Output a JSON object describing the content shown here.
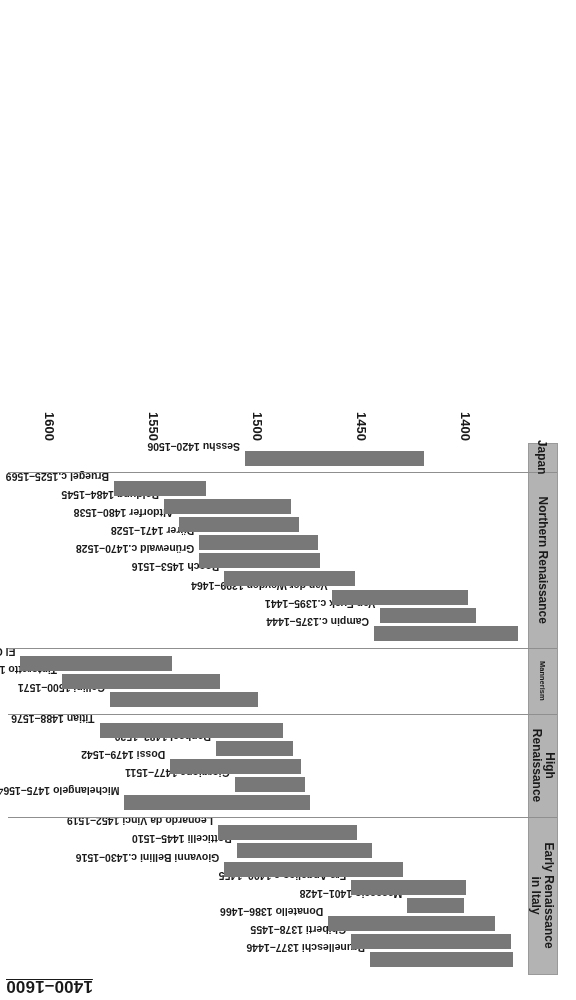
{
  "chart_data": {
    "type": "bar",
    "orientation": "timeline-horizontal-spans",
    "title": "1400–1600",
    "xlabel": "",
    "ylabel": "",
    "xlim": [
      1370,
      1620
    ],
    "ticks": [
      1400,
      1450,
      1500,
      1550,
      1600
    ],
    "grid": false,
    "legend": "none",
    "bar_color": "#787878",
    "band_color": "#b3b3b3",
    "categories": [
      "Early Renaissance in Italy",
      "High Renaissance",
      "Mannerism",
      "Northern Renaissance",
      "Japan"
    ],
    "groups": [
      {
        "category": "Early Renaissance in Italy",
        "category_lines": [
          "Early Renaissance",
          "in Italy"
        ],
        "bars": [
          {
            "label": "Brunelleschi 1377–1446",
            "start": 1377,
            "end": 1446
          },
          {
            "label": "Ghiberti 1378–1455",
            "start": 1378,
            "end": 1455
          },
          {
            "label": "Donatello 1386–1466",
            "start": 1386,
            "end": 1466
          },
          {
            "label": "Masaccio 1401–1428",
            "start": 1401,
            "end": 1428
          },
          {
            "label": "Fra Angelico c.1400–1455",
            "start": 1400,
            "end": 1455
          },
          {
            "label": "Giovanni Bellini c.1430–1516",
            "start": 1430,
            "end": 1516
          },
          {
            "label": "Botticelli 1445–1510",
            "start": 1445,
            "end": 1510
          },
          {
            "label": "Leonardo da Vinci 1452–1519",
            "start": 1452,
            "end": 1519
          }
        ]
      },
      {
        "category": "High Renaissance",
        "category_lines": [
          "High",
          "Renaissance"
        ],
        "bars": [
          {
            "label": "Michelangelo 1475–1564",
            "start": 1475,
            "end": 1564
          },
          {
            "label": "Giorgione 1477–1511",
            "start": 1477,
            "end": 1511
          },
          {
            "label": "Dossi 1479–1542",
            "start": 1479,
            "end": 1542
          },
          {
            "label": "Raphael 1483–1520",
            "start": 1483,
            "end": 1520
          },
          {
            "label": "Titian 1488–1576",
            "start": 1488,
            "end": 1576
          }
        ]
      },
      {
        "category": "Mannerism",
        "category_lines": [
          "Mannerism"
        ],
        "bars": [
          {
            "label": "Cellini 1500–1571",
            "start": 1500,
            "end": 1571
          },
          {
            "label": "Tintoretto 1518–1594",
            "start": 1518,
            "end": 1594
          },
          {
            "label": "El Greco 1541–1614",
            "start": 1541,
            "end": 1614
          }
        ]
      },
      {
        "category": "Northern Renaissance",
        "category_lines": [
          "Northern Renaissance"
        ],
        "bars": [
          {
            "label": "Campin c.1375–1444",
            "start": 1375,
            "end": 1444
          },
          {
            "label": "Van Eyck c.1395–1441",
            "start": 1395,
            "end": 1441
          },
          {
            "label": "Van der Weyden 1399–1464",
            "start": 1399,
            "end": 1464
          },
          {
            "label": "Bosch 1453–1516",
            "start": 1453,
            "end": 1516
          },
          {
            "label": "Grünewald c.1470–1528",
            "start": 1470,
            "end": 1528
          },
          {
            "label": "Dürer 1471–1528",
            "start": 1471,
            "end": 1528
          },
          {
            "label": "Altdorfer 1480–1538",
            "start": 1480,
            "end": 1538
          },
          {
            "label": "Baldung 1484–1545",
            "start": 1484,
            "end": 1545
          },
          {
            "label": "Bruegel c.1525–1569",
            "start": 1525,
            "end": 1569
          }
        ]
      },
      {
        "category": "Japan",
        "category_lines": [
          "Japan"
        ],
        "bars": [
          {
            "label": "Sesshu 1420–1506",
            "start": 1420,
            "end": 1506
          }
        ]
      }
    ]
  }
}
